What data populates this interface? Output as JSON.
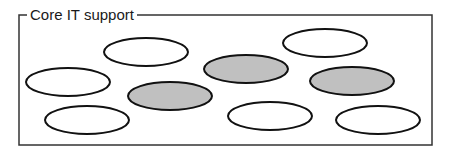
{
  "group": {
    "label": "Core IT support",
    "frame": {
      "x": 19,
      "y": 15,
      "width": 413,
      "height": 130,
      "stroke": "#333333"
    }
  },
  "ellipses": [
    {
      "id": "e1",
      "cx": 146,
      "cy": 52,
      "rx": 42,
      "ry": 14,
      "filled": false
    },
    {
      "id": "e2",
      "cx": 68,
      "cy": 82,
      "rx": 42,
      "ry": 14,
      "filled": false
    },
    {
      "id": "e3",
      "cx": 170,
      "cy": 96,
      "rx": 42,
      "ry": 14,
      "filled": true
    },
    {
      "id": "e4",
      "cx": 246,
      "cy": 69,
      "rx": 42,
      "ry": 14,
      "filled": true
    },
    {
      "id": "e5",
      "cx": 325,
      "cy": 43,
      "rx": 42,
      "ry": 14,
      "filled": false
    },
    {
      "id": "e6",
      "cx": 352,
      "cy": 81,
      "rx": 42,
      "ry": 14,
      "filled": true
    },
    {
      "id": "e7",
      "cx": 87,
      "cy": 120,
      "rx": 42,
      "ry": 14,
      "filled": false
    },
    {
      "id": "e8",
      "cx": 270,
      "cy": 116,
      "rx": 42,
      "ry": 14,
      "filled": false
    },
    {
      "id": "e9",
      "cx": 378,
      "cy": 120,
      "rx": 42,
      "ry": 14,
      "filled": false
    }
  ],
  "colors": {
    "fill_gray": "#c0c0c0",
    "fill_white": "#ffffff",
    "stroke": "#111111"
  }
}
